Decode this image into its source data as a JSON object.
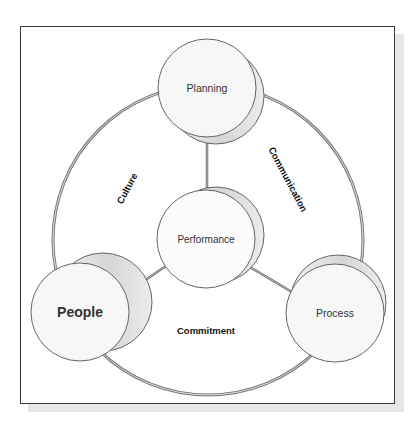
{
  "diagram": {
    "center_node": {
      "label": "Performance"
    },
    "nodes": [
      {
        "id": "planning",
        "label": "Planning"
      },
      {
        "id": "people",
        "label": "People"
      },
      {
        "id": "process",
        "label": "Process"
      }
    ],
    "ring_labels": {
      "culture": "Culture",
      "communication": "Communication",
      "commitment": "Commitment"
    },
    "colors": {
      "frame_border": "#3a3a3a",
      "shadow": "#e6e6e6",
      "ring_stroke": "#8c8c8c",
      "node_fill": "#f7f7f7",
      "node_stroke": "#555555",
      "cylinder_shade": "#d8d8d8"
    }
  }
}
